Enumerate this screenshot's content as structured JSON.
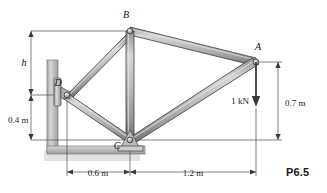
{
  "figure": {
    "label": "P6.5",
    "joints": [
      {
        "id": "A",
        "label": "A",
        "x": 256,
        "y": 62,
        "label_x": 258,
        "label_y": 50
      },
      {
        "id": "B",
        "label": "B",
        "x": 130,
        "y": 31,
        "label_x": 126,
        "label_y": 18
      },
      {
        "id": "C",
        "label": "C",
        "x": 130,
        "y": 140,
        "label_x": 117,
        "label_y": 147
      },
      {
        "id": "D",
        "label": "D",
        "x": 67,
        "y": 95,
        "label_x": 58,
        "label_y": 85
      }
    ],
    "members": [
      {
        "from": "D",
        "to": "B"
      },
      {
        "from": "B",
        "to": "A"
      },
      {
        "from": "B",
        "to": "C"
      },
      {
        "from": "D",
        "to": "C"
      },
      {
        "from": "C",
        "to": "A"
      }
    ],
    "load": {
      "label": "1 kN",
      "label_x": 229,
      "label_y": 103,
      "at_joint": "A",
      "direction": "down",
      "tip_x": 256,
      "tip_y": 106
    },
    "dimensions": [
      {
        "name": "h",
        "label": "h",
        "orientation": "vertical",
        "text_x": 24,
        "text_y": 62,
        "line_x": 31,
        "from": 31,
        "to": 95
      },
      {
        "name": "0.4 m",
        "label": "0.4 m",
        "orientation": "vertical",
        "text_x": 7,
        "text_y": 120,
        "line_x": 31,
        "from": 95,
        "to": 140
      },
      {
        "name": "0.7 m",
        "label": "0.7 m",
        "orientation": "vertical",
        "text_x": 286,
        "text_y": 104,
        "line_x": 278,
        "from": 62,
        "to": 140
      },
      {
        "name": "0.6 m",
        "label": "0.6 m",
        "orientation": "horizontal",
        "text_x": 81,
        "text_y": 175,
        "line_y": 172,
        "from": 67,
        "to": 130
      },
      {
        "name": "1.2 m",
        "label": "1.2 m",
        "orientation": "horizontal",
        "text_x": 182,
        "text_y": 175,
        "line_y": 172,
        "from": 130,
        "to": 256
      }
    ],
    "colors": {
      "member_fill": "#b9b9b9",
      "member_edge": "#3a3a3a",
      "member_highlight": "#dcdcdc",
      "wall": "#c3c3c3",
      "ground": "#c3c3c3",
      "dimension_line": "#4a4a4a",
      "text": "#111111"
    }
  }
}
